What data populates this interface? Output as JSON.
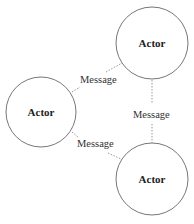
{
  "diagram": {
    "nodes": [
      {
        "id": "actor-top",
        "label": "Actor",
        "cx": 152,
        "cy": 43,
        "r": 36
      },
      {
        "id": "actor-left",
        "label": "Actor",
        "cx": 41,
        "cy": 112,
        "r": 35
      },
      {
        "id": "actor-bottom",
        "label": "Actor",
        "cx": 152,
        "cy": 179,
        "r": 36
      }
    ],
    "edges": [
      {
        "from": "actor-left",
        "to": "actor-top",
        "label": "Message"
      },
      {
        "from": "actor-top",
        "to": "actor-bottom",
        "label": "Message"
      },
      {
        "from": "actor-left",
        "to": "actor-bottom",
        "label": "Message"
      }
    ],
    "colors": {
      "stroke": "#777777",
      "edge": "#999999",
      "text": "#222222"
    }
  }
}
